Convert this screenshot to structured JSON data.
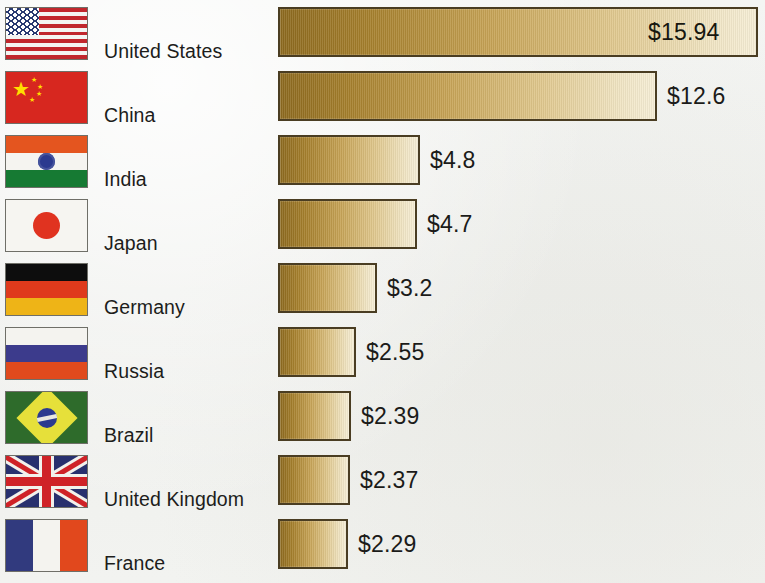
{
  "chart_data": {
    "type": "bar",
    "orientation": "horizontal",
    "title": "",
    "xlabel": "",
    "ylabel": "",
    "value_prefix": "$",
    "grid": false,
    "legend": false,
    "categories": [
      "United States",
      "China",
      "India",
      "Japan",
      "Germany",
      "Russia",
      "Brazil",
      "United Kingdom",
      "France"
    ],
    "values": [
      15.94,
      12.6,
      4.8,
      4.7,
      3.2,
      2.55,
      2.39,
      2.37,
      2.29
    ],
    "value_labels": [
      "$15.94",
      "$12.6",
      "$4.8",
      "$4.7",
      "$3.2",
      "$2.55",
      "$2.39",
      "$2.37",
      "$2.29"
    ],
    "xlim": [
      0,
      16
    ]
  },
  "rows": [
    {
      "country": "United States",
      "value_label": "$15.94",
      "value": 15.94,
      "flag": "flag-united-states",
      "bar_width": 480,
      "label_inside": true,
      "top": 6
    },
    {
      "country": "China",
      "value_label": "$12.6",
      "value": 12.6,
      "flag": "flag-china",
      "bar_width": 379,
      "label_inside": false,
      "top": 70
    },
    {
      "country": "India",
      "value_label": "$4.8",
      "value": 4.8,
      "flag": "flag-india",
      "bar_width": 142,
      "label_inside": false,
      "top": 134
    },
    {
      "country": "Japan",
      "value_label": "$4.7",
      "value": 4.7,
      "flag": "flag-japan",
      "bar_width": 139,
      "label_inside": false,
      "top": 198
    },
    {
      "country": "Germany",
      "value_label": "$3.2",
      "value": 3.2,
      "flag": "flag-germany",
      "bar_width": 99,
      "label_inside": false,
      "top": 262
    },
    {
      "country": "Russia",
      "value_label": "$2.55",
      "value": 2.55,
      "flag": "flag-russia",
      "bar_width": 78,
      "label_inside": false,
      "top": 326
    },
    {
      "country": "Brazil",
      "value_label": "$2.39",
      "value": 2.39,
      "flag": "flag-brazil",
      "bar_width": 73,
      "label_inside": false,
      "top": 390
    },
    {
      "country": "United Kingdom",
      "value_label": "$2.37",
      "value": 2.37,
      "flag": "flag-united-kingdom",
      "bar_width": 72,
      "label_inside": false,
      "top": 454
    },
    {
      "country": "France",
      "value_label": "$2.29",
      "value": 2.29,
      "flag": "flag-france",
      "bar_width": 70,
      "label_inside": false,
      "top": 518
    }
  ],
  "style": {
    "background": "#f1f2f0",
    "bar_gradient_start": "#8d6a1f",
    "bar_gradient_end": "#f6eed6",
    "bar_border": "#4a3d22",
    "text_color": "#1d1d1b"
  }
}
